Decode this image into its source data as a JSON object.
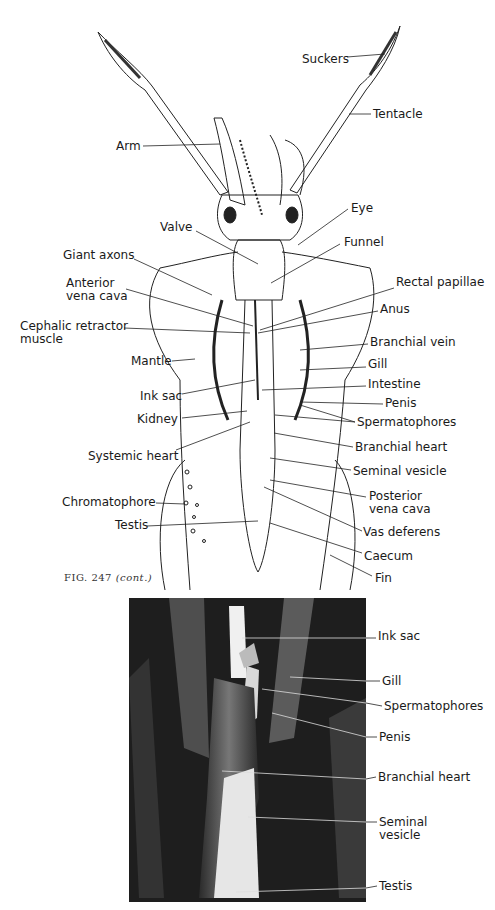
{
  "figure": {
    "caption_number": "FIG. 247",
    "caption_note": "(cont.)"
  },
  "drawing": {
    "labels": [
      {
        "id": "suckers",
        "text": "Suckers",
        "x": 302,
        "y": 53
      },
      {
        "id": "tentacle",
        "text": "Tentacle",
        "x": 373,
        "y": 108
      },
      {
        "id": "arm",
        "text": "Arm",
        "x": 116,
        "y": 140
      },
      {
        "id": "eye",
        "text": "Eye",
        "x": 351,
        "y": 202
      },
      {
        "id": "valve",
        "text": "Valve",
        "x": 160,
        "y": 221
      },
      {
        "id": "funnel",
        "text": "Funnel",
        "x": 344,
        "y": 236
      },
      {
        "id": "giant-axons",
        "text": "Giant axons",
        "x": 63,
        "y": 249
      },
      {
        "id": "anterior-vena-cava",
        "text": "Anterior\nvena cava",
        "x": 66,
        "y": 277
      },
      {
        "id": "rectal-papillae",
        "text": "Rectal papillae",
        "x": 396,
        "y": 276
      },
      {
        "id": "anus",
        "text": "Anus",
        "x": 380,
        "y": 303
      },
      {
        "id": "cephalic-retractor-muscle",
        "text": "Cephalic retractor\nmuscle",
        "x": 20,
        "y": 320
      },
      {
        "id": "branchial-vein",
        "text": "Branchial vein",
        "x": 370,
        "y": 336
      },
      {
        "id": "mantle",
        "text": "Mantle",
        "x": 131,
        "y": 355
      },
      {
        "id": "gill",
        "text": "Gill",
        "x": 368,
        "y": 358
      },
      {
        "id": "intestine",
        "text": "Intestine",
        "x": 368,
        "y": 378
      },
      {
        "id": "ink-sac",
        "text": "Ink sac",
        "x": 140,
        "y": 390
      },
      {
        "id": "penis",
        "text": "Penis",
        "x": 385,
        "y": 397
      },
      {
        "id": "kidney",
        "text": "Kidney",
        "x": 137,
        "y": 413
      },
      {
        "id": "spermatophores",
        "text": "Spermatophores",
        "x": 357,
        "y": 416
      },
      {
        "id": "branchial-heart",
        "text": "Branchial heart",
        "x": 355,
        "y": 441
      },
      {
        "id": "systemic-heart",
        "text": "Systemic heart",
        "x": 88,
        "y": 450
      },
      {
        "id": "seminal-vesicle",
        "text": "Seminal vesicle",
        "x": 353,
        "y": 465
      },
      {
        "id": "posterior-vena-cava",
        "text": "Posterior\nvena cava",
        "x": 369,
        "y": 490
      },
      {
        "id": "chromatophore",
        "text": "Chromatophore",
        "x": 62,
        "y": 496
      },
      {
        "id": "testis",
        "text": "Testis",
        "x": 115,
        "y": 519
      },
      {
        "id": "vas-deferens",
        "text": "Vas deferens",
        "x": 363,
        "y": 526
      },
      {
        "id": "caecum",
        "text": "Caecum",
        "x": 364,
        "y": 550
      },
      {
        "id": "fin",
        "text": "Fin",
        "x": 375,
        "y": 572
      }
    ]
  },
  "photo": {
    "labels": [
      {
        "id": "ink-sac",
        "text": "Ink sac",
        "x": 378,
        "y": 630
      },
      {
        "id": "gill",
        "text": "Gill",
        "x": 382,
        "y": 675
      },
      {
        "id": "spermatophores",
        "text": "Spermatophores",
        "x": 384,
        "y": 700
      },
      {
        "id": "penis",
        "text": "Penis",
        "x": 379,
        "y": 731
      },
      {
        "id": "branchial-heart",
        "text": "Branchial heart",
        "x": 378,
        "y": 771
      },
      {
        "id": "seminal-vesicle",
        "text": "Seminal\nvesicle",
        "x": 379,
        "y": 816
      },
      {
        "id": "testis",
        "text": "Testis",
        "x": 379,
        "y": 880
      }
    ]
  }
}
